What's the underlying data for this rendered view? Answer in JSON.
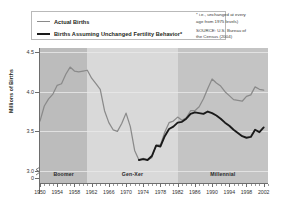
{
  "legend": {
    "items": [
      {
        "label": "Actual Births",
        "style": "thin",
        "color": "#8a8a8a"
      },
      {
        "label": "Births Assuming Unchanged Fertility Behavior*",
        "style": "thick",
        "color": "#1a1a1a"
      }
    ]
  },
  "source": {
    "line1": "* i.e., unchanged at every",
    "line2": "age from 1975 levels)",
    "line3": "SOURCE: U.S. Bureau of",
    "line4": "the Census (2004)"
  },
  "chart_data": {
    "type": "line",
    "title": "",
    "xlabel": "",
    "ylabel": "Millions of Births",
    "xlim": [
      1950,
      2003
    ],
    "ylim": [
      2.85,
      4.55
    ],
    "yticks": [
      "4.5",
      "4.0",
      "3.5",
      "3.0",
      "0"
    ],
    "ytick_values": [
      4.5,
      4.0,
      3.5,
      3.0
    ],
    "axis_break": true,
    "grid": true,
    "legend_position": "top-left",
    "xticks": [
      1950,
      1954,
      1958,
      1962,
      1966,
      1970,
      1974,
      1978,
      1982,
      1986,
      1990,
      1994,
      1998,
      2002
    ],
    "bands": [
      {
        "name": "Boomer",
        "start": 1950,
        "end": 1961,
        "color": "#bcbcbc"
      },
      {
        "name": "Gen-Xer",
        "start": 1961,
        "end": 1982,
        "color": "#d9d9d9"
      },
      {
        "name": "Millennial",
        "start": 1982,
        "end": 2003,
        "color": "#c4c4c4"
      }
    ],
    "x": [
      1950,
      1951,
      1952,
      1953,
      1954,
      1955,
      1956,
      1957,
      1958,
      1959,
      1960,
      1961,
      1962,
      1963,
      1964,
      1965,
      1966,
      1967,
      1968,
      1969,
      1970,
      1971,
      1972,
      1973,
      1974,
      1975,
      1976,
      1977,
      1978,
      1979,
      1980,
      1981,
      1982,
      1983,
      1984,
      1985,
      1986,
      1987,
      1988,
      1989,
      1990,
      1991,
      1992,
      1993,
      1994,
      1995,
      1996,
      1997,
      1998,
      1999,
      2000,
      2001,
      2002
    ],
    "series": [
      {
        "name": "Actual Births",
        "color": "#8a8a8a",
        "width": "thin",
        "values": [
          3.63,
          3.82,
          3.91,
          3.97,
          4.08,
          4.1,
          4.22,
          4.31,
          4.26,
          4.25,
          4.26,
          4.27,
          4.17,
          4.1,
          4.03,
          3.76,
          3.61,
          3.52,
          3.5,
          3.6,
          3.73,
          3.56,
          3.26,
          3.14,
          3.16,
          3.14,
          3.17,
          3.33,
          3.33,
          3.49,
          3.61,
          3.63,
          3.68,
          3.64,
          3.67,
          3.76,
          3.76,
          3.81,
          3.91,
          4.04,
          4.16,
          4.11,
          4.07,
          4.0,
          3.95,
          3.9,
          3.89,
          3.88,
          3.94,
          3.96,
          4.06,
          4.03,
          4.02
        ]
      },
      {
        "name": "Births Assuming Unchanged Fertility Behavior*",
        "color": "#1a1a1a",
        "width": "thick",
        "values": [
          null,
          null,
          null,
          null,
          null,
          null,
          null,
          null,
          null,
          null,
          null,
          null,
          null,
          null,
          null,
          null,
          null,
          null,
          null,
          null,
          null,
          null,
          null,
          3.14,
          3.15,
          3.14,
          3.19,
          3.32,
          3.31,
          3.44,
          3.53,
          3.56,
          3.61,
          3.62,
          3.66,
          3.72,
          3.74,
          3.73,
          3.72,
          3.75,
          3.73,
          3.7,
          3.66,
          3.61,
          3.57,
          3.52,
          3.48,
          3.44,
          3.42,
          3.43,
          3.52,
          3.49,
          3.55
        ]
      }
    ]
  }
}
